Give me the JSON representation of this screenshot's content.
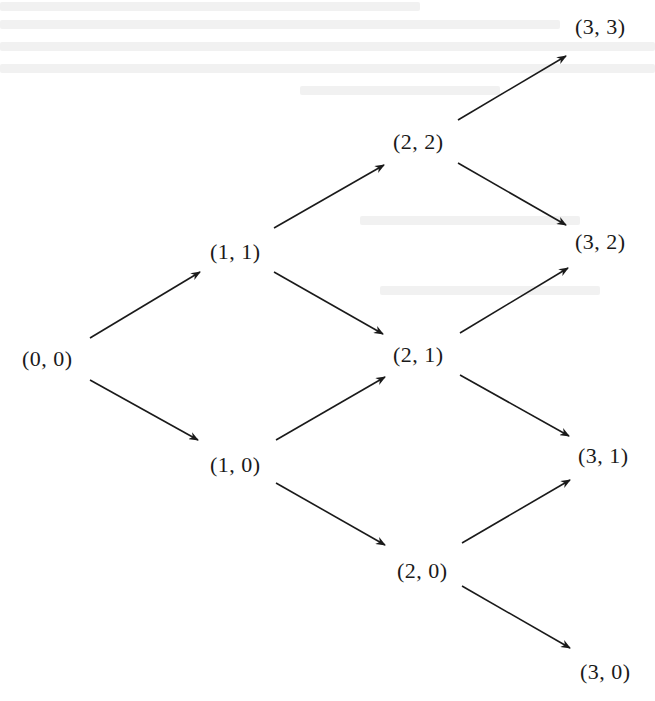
{
  "diagram": {
    "type": "lattice-state-diagram",
    "colors": {
      "background": "#ffffff",
      "text": "#1a1a1a",
      "arrow": "#1a1a1a",
      "bleed_through": "#f1f1f1"
    },
    "nodes": [
      {
        "id": "0-0",
        "label": "(0, 0)",
        "x": 22,
        "y": 348
      },
      {
        "id": "1-1",
        "label": "(1, 1)",
        "x": 210,
        "y": 241
      },
      {
        "id": "1-0",
        "label": "(1, 0)",
        "x": 210,
        "y": 454
      },
      {
        "id": "2-2",
        "label": "(2, 2)",
        "x": 393,
        "y": 131
      },
      {
        "id": "2-1",
        "label": "(2, 1)",
        "x": 393,
        "y": 344
      },
      {
        "id": "2-0",
        "label": "(2, 0)",
        "x": 397,
        "y": 560
      },
      {
        "id": "3-3",
        "label": "(3, 3)",
        "x": 575,
        "y": 16
      },
      {
        "id": "3-2",
        "label": "(3, 2)",
        "x": 575,
        "y": 231
      },
      {
        "id": "3-1",
        "label": "(3, 1)",
        "x": 578,
        "y": 445
      },
      {
        "id": "3-0",
        "label": "(3, 0)",
        "x": 580,
        "y": 661
      }
    ],
    "edges": [
      {
        "from": "0-0",
        "to": "1-1",
        "x1": 90,
        "y1": 338,
        "x2": 200,
        "y2": 272
      },
      {
        "from": "0-0",
        "to": "1-0",
        "x1": 90,
        "y1": 380,
        "x2": 198,
        "y2": 440
      },
      {
        "from": "1-1",
        "to": "2-2",
        "x1": 274,
        "y1": 228,
        "x2": 384,
        "y2": 165
      },
      {
        "from": "1-1",
        "to": "2-1",
        "x1": 274,
        "y1": 272,
        "x2": 383,
        "y2": 334
      },
      {
        "from": "1-0",
        "to": "2-1",
        "x1": 276,
        "y1": 440,
        "x2": 385,
        "y2": 377
      },
      {
        "from": "1-0",
        "to": "2-0",
        "x1": 276,
        "y1": 483,
        "x2": 385,
        "y2": 545
      },
      {
        "from": "2-2",
        "to": "3-3",
        "x1": 458,
        "y1": 120,
        "x2": 566,
        "y2": 56
      },
      {
        "from": "2-2",
        "to": "3-2",
        "x1": 458,
        "y1": 163,
        "x2": 566,
        "y2": 225
      },
      {
        "from": "2-1",
        "to": "3-2",
        "x1": 460,
        "y1": 333,
        "x2": 568,
        "y2": 268
      },
      {
        "from": "2-1",
        "to": "3-1",
        "x1": 460,
        "y1": 375,
        "x2": 569,
        "y2": 436
      },
      {
        "from": "2-0",
        "to": "3-1",
        "x1": 462,
        "y1": 543,
        "x2": 570,
        "y2": 480
      },
      {
        "from": "2-0",
        "to": "3-0",
        "x1": 462,
        "y1": 586,
        "x2": 570,
        "y2": 648
      }
    ]
  }
}
